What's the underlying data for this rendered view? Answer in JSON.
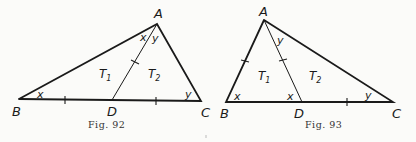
{
  "figures": [
    {
      "id": "fig92",
      "caption": "Fig. 92",
      "vertices": {
        "A": "A",
        "B": "B",
        "C": "C",
        "D": "D"
      },
      "angle_labels": {
        "at_A_left": "x",
        "at_A_right": "y",
        "at_B": "x",
        "at_C": "y"
      },
      "regions": {
        "T1": "T",
        "T1_sub": "1",
        "T2": "T",
        "T2_sub": "2"
      }
    },
    {
      "id": "fig93",
      "caption": "Fig. 93",
      "vertices": {
        "A": "A",
        "B": "B",
        "C": "C",
        "D": "D"
      },
      "angle_labels": {
        "at_A": "y",
        "at_B": "x",
        "at_D": "x",
        "at_C": "y"
      },
      "regions": {
        "T1": "T",
        "T1_sub": "1",
        "T2": "T",
        "T2_sub": "2"
      }
    }
  ]
}
